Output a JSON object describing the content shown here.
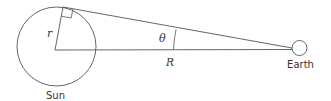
{
  "diagram": {
    "labels": {
      "sun": "Sun",
      "earth": "Earth",
      "radius": "r",
      "distance": "R",
      "angle": "θ"
    },
    "colors": {
      "stroke": "#555555",
      "text": "#333333",
      "background": "#ffffff"
    }
  }
}
